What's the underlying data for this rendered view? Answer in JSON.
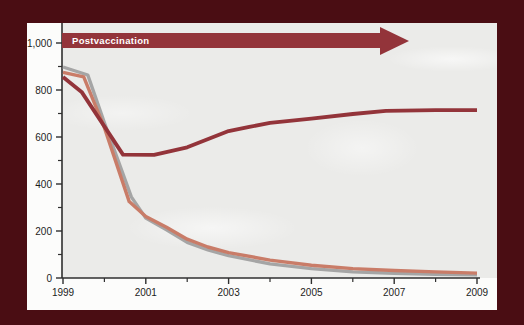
{
  "colors": {
    "accent_dark_red": "#93343a",
    "line_gray": "#a5a5a5",
    "line_salmon": "#c97c68",
    "panel": "#fcfcfb",
    "plot_background": "#ebebe9",
    "axis": "#2f2f2f",
    "axis_text": "#1c1c1c",
    "annotation_text": "#ffffff",
    "background_maroon": "#4a0d13"
  },
  "chart_data": {
    "type": "line",
    "title": "",
    "annotation": "Postvaccination",
    "xlabel": "",
    "ylabel": "",
    "x_range": [
      1999,
      2009
    ],
    "y_range": [
      0,
      1000
    ],
    "grid": false,
    "legend": "none",
    "x_axis": {
      "major": [
        {
          "v": 1999,
          "label": "1999"
        },
        {
          "v": 2001,
          "label": "2001"
        },
        {
          "v": 2003,
          "label": "2003"
        },
        {
          "v": 2005,
          "label": "2005"
        },
        {
          "v": 2007,
          "label": "2007"
        },
        {
          "v": 2009,
          "label": "2009"
        }
      ],
      "minor": [
        2000,
        2002,
        2004,
        2006,
        2008
      ]
    },
    "y_axis": {
      "major": [
        {
          "v": 0,
          "label": "0"
        },
        {
          "v": 200,
          "label": "200"
        },
        {
          "v": 400,
          "label": "400"
        },
        {
          "v": 600,
          "label": "600"
        },
        {
          "v": 800,
          "label": "800"
        },
        {
          "v": 1000,
          "label": "1,000"
        }
      ],
      "minor": [
        100,
        300,
        500,
        700,
        900
      ]
    },
    "series": [
      {
        "name": "gray",
        "color": "#a5a5a5",
        "width": 3.4,
        "points": [
          [
            1999,
            898
          ],
          [
            1999.6,
            864
          ],
          [
            2000,
            660
          ],
          [
            2000.65,
            345
          ],
          [
            2001,
            255
          ],
          [
            2001.5,
            205
          ],
          [
            2002,
            152
          ],
          [
            2002.5,
            120
          ],
          [
            2003,
            95
          ],
          [
            2004,
            60
          ],
          [
            2005,
            40
          ],
          [
            2006,
            26
          ],
          [
            2007,
            20
          ],
          [
            2008,
            16
          ],
          [
            2009,
            14
          ]
        ]
      },
      {
        "name": "salmon",
        "color": "#c97c68",
        "width": 3.4,
        "points": [
          [
            1999,
            875
          ],
          [
            1999.5,
            856
          ],
          [
            2000,
            640
          ],
          [
            2000.6,
            325
          ],
          [
            2001,
            262
          ],
          [
            2001.5,
            216
          ],
          [
            2002,
            165
          ],
          [
            2002.5,
            132
          ],
          [
            2003,
            108
          ],
          [
            2004,
            76
          ],
          [
            2005,
            54
          ],
          [
            2006,
            40
          ],
          [
            2007,
            32
          ],
          [
            2008,
            26
          ],
          [
            2009,
            21
          ]
        ]
      },
      {
        "name": "dark-red",
        "color": "#93343a",
        "width": 3.8,
        "points": [
          [
            1999,
            855
          ],
          [
            1999.45,
            792
          ],
          [
            2000.45,
            525
          ],
          [
            2001.2,
            524
          ],
          [
            2002,
            556
          ],
          [
            2003,
            625
          ],
          [
            2003.5,
            643
          ],
          [
            2004,
            660
          ],
          [
            2005,
            678
          ],
          [
            2006,
            698
          ],
          [
            2006.8,
            711
          ],
          [
            2008,
            714
          ],
          [
            2009,
            714
          ]
        ]
      }
    ]
  }
}
